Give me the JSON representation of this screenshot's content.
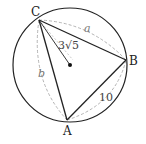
{
  "diagram": {
    "type": "inscribed-triangle-in-circle",
    "circle": {
      "cx": 70,
      "cy": 65,
      "r": 57
    },
    "center_dot": {
      "x": 70,
      "y": 65
    },
    "points": {
      "A": {
        "label": "A",
        "x": 67,
        "y": 120
      },
      "B": {
        "label": "B",
        "x": 126,
        "y": 60
      },
      "C": {
        "label": "C",
        "x": 39,
        "y": 20
      }
    },
    "labels": {
      "radius": "3√5",
      "side_a": "a",
      "side_b": "b",
      "side_AB": "10"
    },
    "colors": {
      "stroke": "#222222",
      "dashed": "#aaaaaa"
    }
  }
}
